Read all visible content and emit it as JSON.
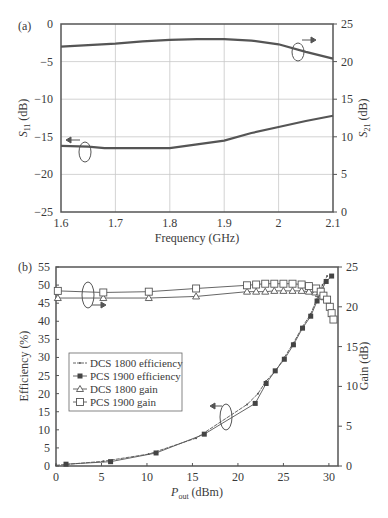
{
  "chart_data": [
    {
      "panel": "(a)",
      "type": "line",
      "title": "",
      "xlabel": "Frequency (GHz)",
      "ylabel": "S11 (dB)",
      "y2label": "S21 (dB)",
      "xlim": [
        1.6,
        2.1
      ],
      "ylim": [
        -25,
        0
      ],
      "y2lim": [
        0,
        25
      ],
      "xticks": [
        "1.6",
        "1.7",
        "1.8",
        "1.9",
        "2",
        "2.1"
      ],
      "yticks": [
        "0",
        "−5",
        "−10",
        "−15",
        "−20",
        "−25"
      ],
      "y2ticks": [
        "25",
        "20",
        "15",
        "10",
        "5",
        "0"
      ],
      "grid": true,
      "series": [
        {
          "name": "S11",
          "axis": "left",
          "x": [
            1.6,
            1.65,
            1.68,
            1.7,
            1.75,
            1.8,
            1.85,
            1.9,
            1.95,
            2.0,
            2.05,
            2.1
          ],
          "y": [
            -16.2,
            -16.3,
            -16.5,
            -16.5,
            -16.5,
            -16.5,
            -16.0,
            -15.5,
            -14.5,
            -13.7,
            -12.9,
            -12.2
          ]
        },
        {
          "name": "S21",
          "axis": "right",
          "x": [
            1.6,
            1.65,
            1.7,
            1.75,
            1.8,
            1.85,
            1.9,
            1.95,
            2.0,
            2.05,
            2.1
          ],
          "y": [
            22.0,
            22.2,
            22.4,
            22.7,
            22.9,
            23.0,
            23.0,
            22.8,
            22.3,
            21.3,
            20.4
          ]
        }
      ]
    },
    {
      "panel": "(b)",
      "type": "line",
      "title": "",
      "xlabel": "P_out (dBm)",
      "ylabel": "Efficiency (%)",
      "y2label": "Gain (dB)",
      "xlim": [
        0,
        31
      ],
      "ylim": [
        0,
        55
      ],
      "y2lim": [
        0,
        25
      ],
      "xticks": [
        "0",
        "5",
        "10",
        "15",
        "20",
        "25",
        "30"
      ],
      "yticks": [
        "55",
        "50",
        "45",
        "40",
        "35",
        "30",
        "25",
        "20",
        "15",
        "10",
        "5",
        "0"
      ],
      "y2ticks": [
        "25",
        "20",
        "15",
        "10",
        "5",
        "0"
      ],
      "grid": false,
      "legend": [
        "DCS 1800 efficiency",
        "PCS 1900 efficiency",
        "DCS 1800 gain",
        "PCS 1900 gain"
      ],
      "series": [
        {
          "name": "DCS 1800 efficiency",
          "axis": "left",
          "marker": "small-dot",
          "x": [
            0,
            5.2,
            10.2,
            15.4,
            21,
            22.2,
            23.1,
            24.2,
            25.1,
            26.1,
            27.1,
            28,
            28.8,
            29.3,
            29.8
          ],
          "y": [
            0.2,
            1.3,
            3.3,
            7.7,
            17.0,
            20.0,
            23.5,
            26.5,
            30.0,
            34.0,
            38.5,
            42.0,
            47.0,
            50.0,
            52.5
          ]
        },
        {
          "name": "PCS 1900 efficiency",
          "axis": "left",
          "marker": "filled-square",
          "x": [
            1.1,
            6,
            11,
            16.3,
            21.9,
            23.1,
            24.1,
            25.1,
            26.1,
            27.1,
            28,
            28.7,
            29.2,
            29.7,
            30.3
          ],
          "y": [
            0.5,
            1.2,
            3.6,
            8.8,
            17.3,
            22.8,
            26.3,
            29.5,
            33.5,
            38.1,
            41.4,
            45.6,
            48.6,
            51.0,
            52.5
          ]
        },
        {
          "name": "DCS 1800 gain",
          "axis": "right",
          "marker": "open-triangle",
          "x": [
            0.2,
            5.2,
            10.2,
            15.4,
            21,
            22,
            23,
            24,
            25,
            26,
            27,
            27.8,
            28.5,
            28.9,
            29.2,
            29.5
          ],
          "y": [
            21.1,
            21.1,
            21.1,
            21.3,
            21.9,
            21.9,
            21.9,
            22.0,
            22.0,
            22.0,
            22.0,
            21.9,
            21.8,
            21.6,
            21.4,
            21.2
          ]
        },
        {
          "name": "PCS 1900 gain",
          "axis": "right",
          "marker": "open-square",
          "x": [
            0.2,
            5.2,
            10.2,
            15.4,
            21,
            22,
            23,
            24,
            25,
            26,
            27,
            27.8,
            28.6,
            29.1,
            29.4,
            29.8,
            30.1,
            30.3,
            30.5
          ],
          "y": [
            22.0,
            21.8,
            21.9,
            22.3,
            22.7,
            22.8,
            22.9,
            22.9,
            22.9,
            22.9,
            22.8,
            22.6,
            22.3,
            21.9,
            21.4,
            20.9,
            20.0,
            19.2,
            18.4
          ]
        }
      ]
    }
  ]
}
